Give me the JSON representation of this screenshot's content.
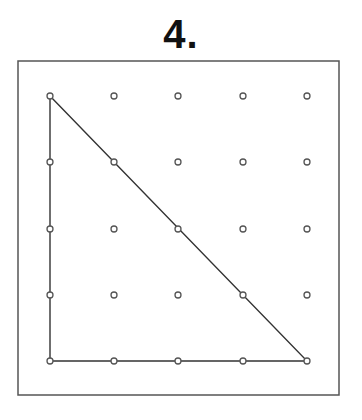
{
  "problem": {
    "label": "4."
  },
  "geoboard": {
    "frame": {
      "x": 18,
      "y": 61,
      "width": 321,
      "height": 334,
      "stroke": "#555555"
    },
    "grid": {
      "columns_x": [
        50,
        114,
        178,
        243,
        307
      ],
      "rows_y": [
        96,
        162,
        229,
        295,
        361
      ],
      "peg_radius": 3,
      "peg_stroke": "#555555"
    },
    "shape": {
      "type": "right-triangle",
      "vertices": [
        [
          0,
          0
        ],
        [
          0,
          4
        ],
        [
          4,
          4
        ]
      ],
      "stroke": "#333333"
    }
  }
}
